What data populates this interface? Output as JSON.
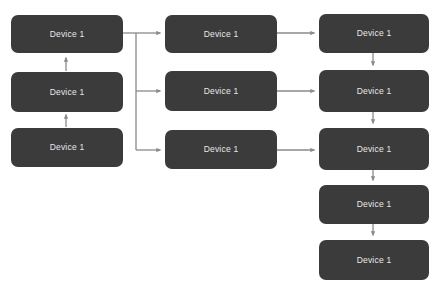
{
  "diagram": {
    "background_color": "#ffffff",
    "node_fill_color": "#3b3b3b",
    "node_text_color": "#e8e8e8",
    "connector_color": "#8a8a8a",
    "nodes": [
      {
        "id": "c1r1",
        "label": "Device 1",
        "x": 11,
        "y": 15,
        "w": 112,
        "h": 38
      },
      {
        "id": "c1r2",
        "label": "Device 1",
        "x": 11,
        "y": 72,
        "w": 112,
        "h": 40
      },
      {
        "id": "c1r3",
        "label": "Device 1",
        "x": 11,
        "y": 128,
        "w": 112,
        "h": 39
      },
      {
        "id": "c2r1",
        "label": "Device 1",
        "x": 165,
        "y": 15,
        "w": 112,
        "h": 38
      },
      {
        "id": "c2r2",
        "label": "Device 1",
        "x": 165,
        "y": 71,
        "w": 112,
        "h": 40
      },
      {
        "id": "c2r3",
        "label": "Device 1",
        "x": 165,
        "y": 130,
        "w": 112,
        "h": 39
      },
      {
        "id": "c3r1",
        "label": "Device 1",
        "x": 319,
        "y": 14,
        "w": 110,
        "h": 39
      },
      {
        "id": "c3r2",
        "label": "Device 1",
        "x": 319,
        "y": 70,
        "w": 110,
        "h": 42
      },
      {
        "id": "c3r3",
        "label": "Device 1",
        "x": 319,
        "y": 128,
        "w": 110,
        "h": 42
      },
      {
        "id": "c3r4",
        "label": "Device 1",
        "x": 319,
        "y": 185,
        "w": 110,
        "h": 39
      },
      {
        "id": "c3r5",
        "label": "Device 1",
        "x": 319,
        "y": 240,
        "w": 110,
        "h": 40
      }
    ],
    "connectors": [
      {
        "id": "c1r3-to-c1r2",
        "from": "c1r3",
        "to": "c1r2",
        "direction": "up"
      },
      {
        "id": "c1r2-to-c1r1",
        "from": "c1r2",
        "to": "c1r1",
        "direction": "up"
      },
      {
        "id": "c1r1-to-trunk",
        "from": "c1r1",
        "to": "trunk",
        "direction": "right"
      },
      {
        "id": "trunk-to-c2r1",
        "from": "trunk",
        "to": "c2r1",
        "direction": "right"
      },
      {
        "id": "trunk-to-c2r2",
        "from": "trunk",
        "to": "c2r2",
        "direction": "right"
      },
      {
        "id": "trunk-to-c2r3",
        "from": "trunk",
        "to": "c2r3",
        "direction": "right"
      },
      {
        "id": "c2r1-to-c3r1",
        "from": "c2r1",
        "to": "c3r1",
        "direction": "right"
      },
      {
        "id": "c2r2-to-c3r2",
        "from": "c2r2",
        "to": "c3r2",
        "direction": "right"
      },
      {
        "id": "c2r3-to-c3r3",
        "from": "c2r3",
        "to": "c3r3",
        "direction": "right"
      },
      {
        "id": "c3r1-to-c3r2",
        "from": "c3r1",
        "to": "c3r2",
        "direction": "down"
      },
      {
        "id": "c3r2-to-c3r3",
        "from": "c3r2",
        "to": "c3r3",
        "direction": "down"
      },
      {
        "id": "c3r3-to-c3r4",
        "from": "c3r3",
        "to": "c3r4",
        "direction": "down"
      },
      {
        "id": "c3r4-to-c3r5",
        "from": "c3r4",
        "to": "c3r5",
        "direction": "down"
      }
    ]
  }
}
